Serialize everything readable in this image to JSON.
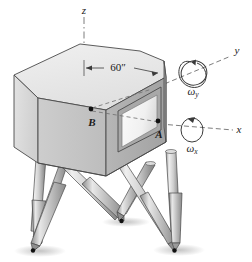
{
  "figure": {
    "type": "engineering-diagram",
    "background_color": "#ffffff"
  },
  "axes": {
    "z": {
      "label": "z",
      "style": "dash-dot vertical",
      "x": 84,
      "y": 10
    },
    "y": {
      "label": "y",
      "style": "dashed, upper right",
      "x": 236,
      "y": 51
    },
    "x": {
      "label": "x",
      "style": "dashed, right",
      "x": 238,
      "y": 130
    }
  },
  "rotations": [
    {
      "name": "omega-y",
      "symbol": "ω",
      "subscript": "y",
      "x": 198,
      "y": 88
    },
    {
      "name": "omega-x",
      "symbol": "ω",
      "subscript": "x",
      "x": 196,
      "y": 146
    }
  ],
  "dimensions": [
    {
      "name": "width-dimension",
      "label": "60″",
      "value": 60,
      "unit": "in",
      "x": 118,
      "y": 68
    }
  ],
  "points": [
    {
      "name": "point-B",
      "label": "B",
      "dot_x": 91,
      "dot_y": 109,
      "label_x": 92,
      "label_y": 122
    },
    {
      "name": "point-A",
      "label": "A",
      "dot_x": 158,
      "dot_y": 121,
      "label_x": 159,
      "label_y": 133
    }
  ],
  "colors": {
    "body_top": "#e8e8e8",
    "body_left": "#d8d8d8",
    "body_front": "#c6c6c6",
    "body_right": "#b4b4b4",
    "window": "#f4f4f4",
    "leg_light": "#e2e2e2",
    "leg_mid": "#b9b9b9",
    "leg_dark": "#8e8e8e",
    "outline": "#3a3a3a",
    "dash": "#6e6e6e",
    "shadow": "#c9c9c9",
    "text": "#1a1a1a"
  },
  "legs": {
    "count": 6,
    "description": "six tapered cylindrical actuators meeting at three ground contact points"
  },
  "ground_contacts": [
    {
      "x": 33,
      "y": 250
    },
    {
      "x": 121,
      "y": 221
    },
    {
      "x": 172,
      "y": 249
    }
  ]
}
